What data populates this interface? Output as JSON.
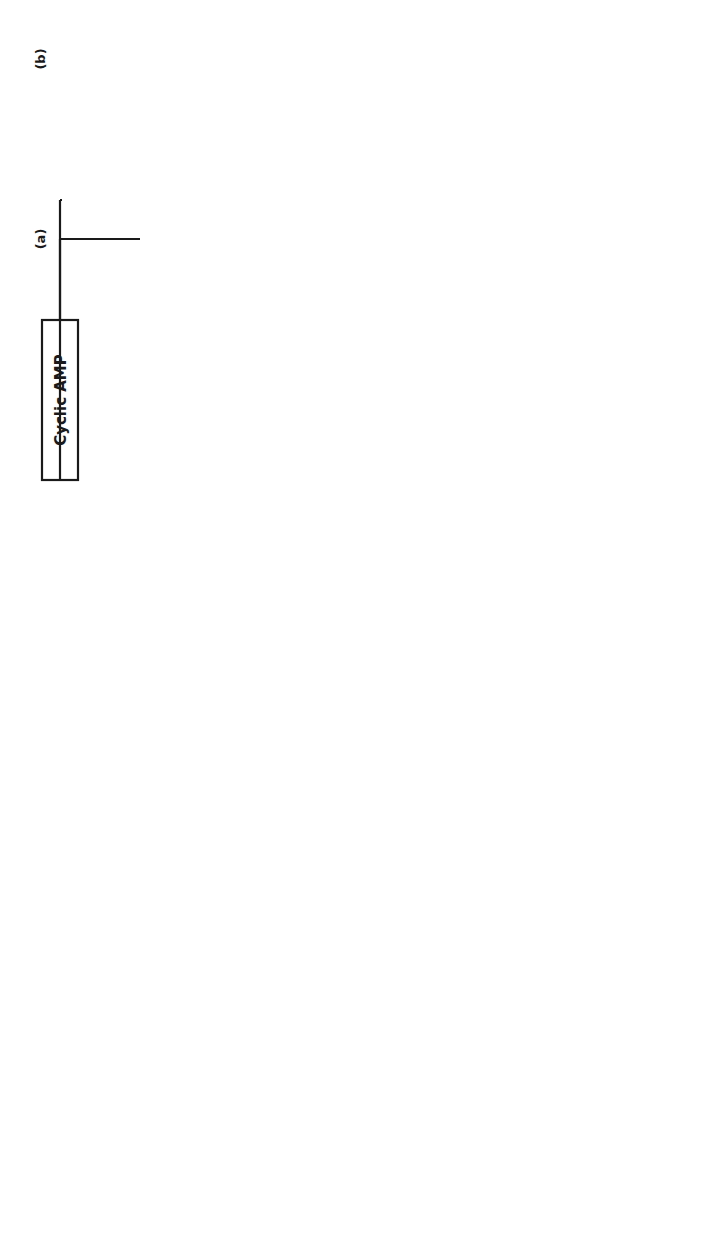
{
  "diagram": {
    "orientation": "rotated 90 degrees counter-clockwise",
    "colors": {
      "ink": "#1a1a1a",
      "background": "#ffffff"
    },
    "regulators": {
      "a": {
        "tag": "(a)",
        "label": "Cyclic AMP"
      },
      "b": {
        "tag": "(b)"
      },
      "c": {
        "tag": "(c)",
        "label": "Cyclic AMP",
        "question": "?"
      },
      "d": {
        "tag": "(d)",
        "label": "Cyclic AMP",
        "question": "?"
      }
    },
    "kinase_kinase": {
      "line1": "Phosphorylase b Kinase",
      "line2": "Kinase",
      "equals": "=",
      "synthase_kinase": "Glycogen Synthase I Kinase"
    },
    "phosphorylase_kinase_cycle": {
      "non_activated_line1": "Non-Activated",
      "non_activated_line2": "Phosphorylase b Kinase",
      "activated_line1": "Activated",
      "activated_line2": "Phosphorylase b Kinase",
      "atp": "ATP",
      "adp": "ADP",
      "pi": "Pi",
      "phosphatase_line1": "Phosphorylase",
      "phosphatase_line2": "Kinase",
      "phosphatase_line3": "Phosphatase"
    },
    "phosphorylase_cycle": {
      "b_form": "2 Phosphorylase b",
      "a_form": "Phosphorylase a",
      "atp": "4 ATP",
      "adp": "4 ADP",
      "pi": "4 Pi"
    },
    "phosphatase_cycle": {
      "activated_line1": "Activated",
      "activated_line2": "Phosphorylase a Phosphatase",
      "non_activated_line1": "Non-Activated",
      "non_activated_line2": "Phosphorylase a Phosphatase",
      "atp_mg": "ATP-Mg"
    },
    "glycogen_cycle": {
      "udpg": "UDPG",
      "glycogen": "GLYCOGEN",
      "g1p": "G-1-P",
      "utp": "UTP",
      "pp": "PP",
      "pi": "Pi",
      "enzyme_line1": "UDPG",
      "enzyme_line2": "Pyrophosphorylase"
    },
    "synthase_cycle": {
      "i_form_line1": "Glycogen",
      "i_form_line2": "Synthase I",
      "d_form_line1": "Glycogen",
      "d_form_line2": "Synthase D",
      "atp": "ATP",
      "adp": "ADP",
      "pi": "Pi",
      "phosphatase_line1": "Glycogen",
      "phosphatase_line2": "Synthase D",
      "phosphatase_line3": "Phosphatase"
    }
  }
}
